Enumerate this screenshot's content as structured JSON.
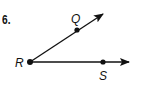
{
  "problem": {
    "number": "6."
  },
  "diagram": {
    "type": "angle",
    "vertex": {
      "label": "R",
      "x": 30,
      "y": 62
    },
    "rays": [
      {
        "through": {
          "label": "Q",
          "x": 77,
          "y": 30
        },
        "arrow_tip": {
          "x": 103,
          "y": 14
        }
      },
      {
        "through": {
          "label": "S",
          "x": 103,
          "y": 62
        },
        "arrow_tip": {
          "x": 129,
          "y": 62
        }
      }
    ],
    "labels": {
      "vertex": "R",
      "upper_point": "Q",
      "lower_point": "S"
    },
    "stroke_color": "#111111"
  }
}
